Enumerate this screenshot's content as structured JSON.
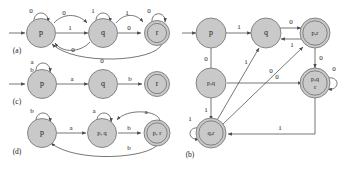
{
  "figure": {
    "caption_labels": [
      "(a)",
      "(c)",
      "(d)",
      "(b)"
    ],
    "colors": {
      "state_fill": "#c9c9c9",
      "state_stroke": "#6f6f6f",
      "edge_stroke": "#4a4a4a",
      "background": "#ffffff",
      "text": "#1a1a1a"
    }
  },
  "automata": [
    {
      "id": "a",
      "panel_label": "(a)",
      "alphabet": [
        "0",
        "1"
      ],
      "states": [
        {
          "id": "p",
          "label": "p",
          "accepting": false,
          "start": true
        },
        {
          "id": "q",
          "label": "q",
          "accepting": false,
          "start": false
        },
        {
          "id": "r",
          "label": "r",
          "accepting": true,
          "start": false
        }
      ],
      "transitions": [
        {
          "from": "p",
          "to": "p",
          "label": "0",
          "kind": "self"
        },
        {
          "from": "p",
          "to": "q",
          "label": "0",
          "kind": "arc-above"
        },
        {
          "from": "p",
          "to": "q",
          "label": "1",
          "kind": "straight"
        },
        {
          "from": "q",
          "to": "p",
          "label": "0",
          "kind": "arc-below"
        },
        {
          "from": "q",
          "to": "q",
          "label": "1",
          "kind": "self"
        },
        {
          "from": "q",
          "to": "r",
          "label": "1",
          "kind": "arc-above"
        },
        {
          "from": "q",
          "to": "r",
          "label": "0",
          "kind": "straight"
        },
        {
          "from": "r",
          "to": "r",
          "label": "0",
          "kind": "self"
        },
        {
          "from": "r",
          "to": "p",
          "label": "0",
          "kind": "arc-below-long"
        }
      ]
    },
    {
      "id": "c",
      "panel_label": "(c)",
      "alphabet": [
        "a",
        "b"
      ],
      "states": [
        {
          "id": "p",
          "label": "p",
          "accepting": false,
          "start": true
        },
        {
          "id": "q",
          "label": "q",
          "accepting": false,
          "start": false
        },
        {
          "id": "r",
          "label": "r",
          "accepting": true,
          "start": false
        }
      ],
      "transitions": [
        {
          "from": "p",
          "to": "p",
          "label": "a",
          "kind": "self"
        },
        {
          "from": "p",
          "to": "p",
          "label": "b",
          "kind": "self"
        },
        {
          "from": "p",
          "to": "q",
          "label": "a",
          "kind": "straight"
        },
        {
          "from": "q",
          "to": "r",
          "label": "b",
          "kind": "straight"
        }
      ]
    },
    {
      "id": "d",
      "panel_label": "(d)",
      "alphabet": [
        "a",
        "b"
      ],
      "states": [
        {
          "id": "p",
          "label": "p",
          "accepting": false,
          "start": true
        },
        {
          "id": "pq",
          "label": "p, q",
          "accepting": false,
          "start": false
        },
        {
          "id": "pr",
          "label": "p, r",
          "accepting": true,
          "start": false
        }
      ],
      "transitions": [
        {
          "from": "p",
          "to": "p",
          "label": "b",
          "kind": "self"
        },
        {
          "from": "p",
          "to": "pq",
          "label": "a",
          "kind": "straight"
        },
        {
          "from": "pq",
          "to": "pq",
          "label": "a",
          "kind": "self"
        },
        {
          "from": "pq",
          "to": "pr",
          "label": "b",
          "kind": "straight"
        },
        {
          "from": "pr",
          "to": "pq",
          "label": "a",
          "kind": "arc-above"
        },
        {
          "from": "pr",
          "to": "p",
          "label": "b",
          "kind": "arc-below-long"
        }
      ]
    },
    {
      "id": "b",
      "panel_label": "(b)",
      "alphabet": [
        "0",
        "1"
      ],
      "states": [
        {
          "id": "p",
          "label": "p",
          "accepting": false,
          "start": true
        },
        {
          "id": "q",
          "label": "q",
          "accepting": false,
          "start": false
        },
        {
          "id": "pr",
          "label": "p,r",
          "accepting": true,
          "start": false
        },
        {
          "id": "pq",
          "label": "p,q",
          "accepting": false,
          "start": false
        },
        {
          "id": "pqr",
          "label": "p,q r",
          "label_line1": "p,q",
          "label_line2": "r",
          "accepting": true,
          "start": false
        },
        {
          "id": "qr",
          "label": "q,r",
          "accepting": true,
          "start": false
        }
      ],
      "transitions": [
        {
          "from": "p",
          "to": "q",
          "label": "1",
          "kind": "straight"
        },
        {
          "from": "p",
          "to": "pq",
          "label": "0",
          "kind": "straight-down"
        },
        {
          "from": "q",
          "to": "pr",
          "label": "0",
          "kind": "arc-above"
        },
        {
          "from": "pr",
          "to": "q",
          "label": "1",
          "kind": "arc-below"
        },
        {
          "from": "pq",
          "to": "pqr",
          "label": "0",
          "kind": "straight"
        },
        {
          "from": "pq",
          "to": "qr",
          "label": "1",
          "kind": "straight-down"
        },
        {
          "from": "pr",
          "to": "pqr",
          "label": "0",
          "kind": "straight-down"
        },
        {
          "from": "pqr",
          "to": "pqr",
          "label": "0",
          "kind": "self"
        },
        {
          "from": "pqr",
          "to": "qr",
          "label": "1",
          "kind": "arc-below-long"
        },
        {
          "from": "qr",
          "to": "pr",
          "label": "0",
          "kind": "diagonal"
        },
        {
          "from": "qr",
          "to": "q",
          "label": "1",
          "kind": "diagonal"
        },
        {
          "from": "qr",
          "to": "qr",
          "label": "1",
          "kind": "self"
        }
      ]
    }
  ],
  "edge_labels": {
    "a_p_self": "0",
    "a_pq_above": "0",
    "a_pq_straight": "1",
    "a_qp_below": "0",
    "a_q_self": "1",
    "a_qr_above": "1",
    "a_qr_straight": "0",
    "a_r_self": "0",
    "a_rp_long": "0",
    "c_p_self_a": "a",
    "c_p_self_b": "b",
    "c_pq": "a",
    "c_qr": "b",
    "d_p_self": "b",
    "d_p_pq": "a",
    "d_pq_self": "a",
    "d_pq_pr": "b",
    "d_pr_pq": "a",
    "d_pr_p": "b",
    "b_p_q": "1",
    "b_p_pq": "0",
    "b_q_pr": "0",
    "b_pr_q": "1",
    "b_pq_pqr": "0",
    "b_pq_qr": "1",
    "b_pr_pqr": "0",
    "b_pqr_self": "0",
    "b_pqr_qr": "1",
    "b_qr_pr": "0",
    "b_qr_q": "1",
    "b_qr_self": "1"
  },
  "state_labels": {
    "a_p": "p",
    "a_q": "q",
    "a_r": "r",
    "c_p": "p",
    "c_q": "q",
    "c_r": "r",
    "d_p": "p",
    "d_pq": "p, q",
    "d_pr": "p, r",
    "b_p": "p",
    "b_q": "q",
    "b_pr": "p,r",
    "b_pq": "p,q",
    "b_pqr_1": "p,q",
    "b_pqr_2": "r",
    "b_qr": "q,r"
  },
  "panel_labels": {
    "a": "(a)",
    "c": "(c)",
    "d": "(d)",
    "b": "(b)"
  }
}
